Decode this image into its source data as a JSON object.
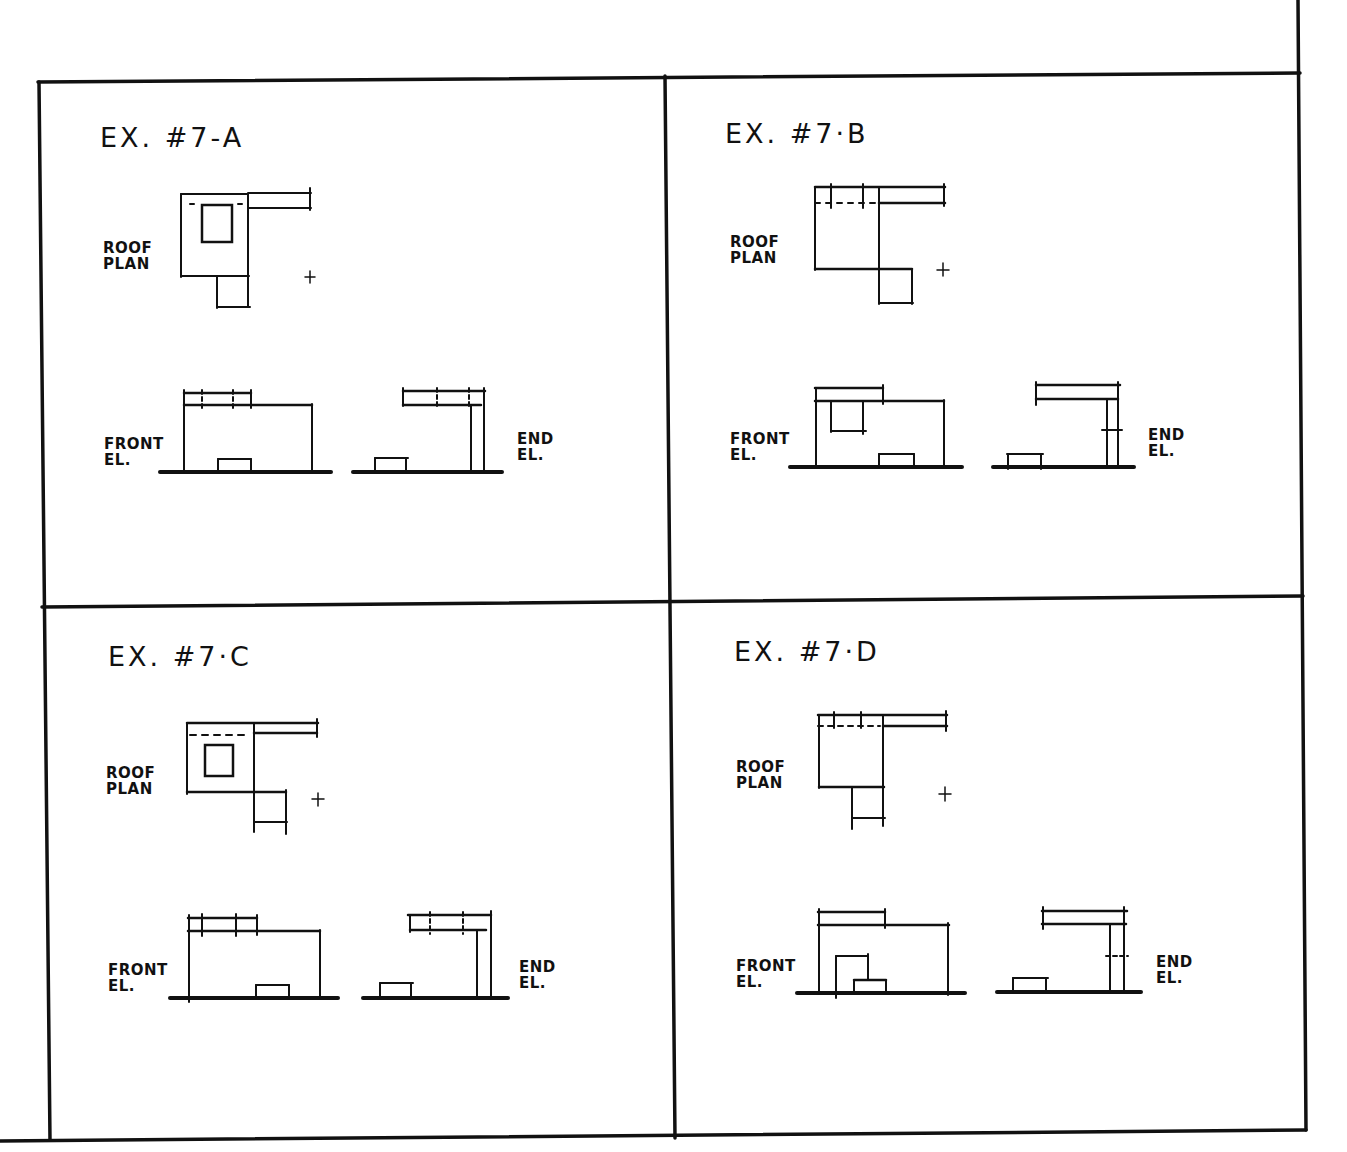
{
  "sheet": {
    "line_color": "#111111",
    "background": "#ffffff"
  },
  "panels": [
    {
      "id": "7A",
      "title": "EX. #7-A",
      "roof_plan_label": [
        "ROOF",
        "PLAN"
      ],
      "front_elevation_label": [
        "FRONT",
        "EL."
      ],
      "end_elevation_label": [
        "END",
        "EL."
      ]
    },
    {
      "id": "7B",
      "title": "EX. #7·B",
      "roof_plan_label": [
        "ROOF",
        "PLAN"
      ],
      "front_elevation_label": [
        "FRONT",
        "EL."
      ],
      "end_elevation_label": [
        "END",
        "EL."
      ]
    },
    {
      "id": "7C",
      "title": "EX. #7·C",
      "roof_plan_label": [
        "ROOF",
        "PLAN"
      ],
      "front_elevation_label": [
        "FRONT",
        "EL."
      ],
      "end_elevation_label": [
        "END",
        "EL."
      ]
    },
    {
      "id": "7D",
      "title": "EX. #7·D",
      "roof_plan_label": [
        "ROOF",
        "PLAN"
      ],
      "front_elevation_label": [
        "FRONT",
        "EL."
      ],
      "end_elevation_label": [
        "END",
        "EL."
      ]
    }
  ]
}
